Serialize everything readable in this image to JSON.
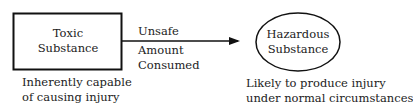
{
  "left_node": {
    "title_line1": "Toxic",
    "title_line2": "Substance",
    "caption_line1": "Inherently capable",
    "caption_line2": "of causing injury"
  },
  "edge": {
    "label_above": "Unsafe",
    "label_below_line1": "Amount",
    "label_below_line2": "Consumed"
  },
  "right_node": {
    "title_line1": "Hazardous",
    "title_line2": "Substance",
    "caption_line1": "Likely to produce injury",
    "caption_line2": "under normal circumstances"
  }
}
